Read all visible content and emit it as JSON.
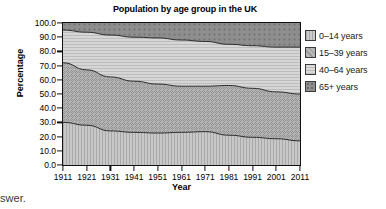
{
  "chart_data": {
    "type": "area",
    "title": "Population by age group in the UK",
    "xlabel": "Year",
    "ylabel": "Percentage",
    "stacked": true,
    "grid": true,
    "legend_position": "right",
    "xlim": [
      1911,
      2011
    ],
    "ylim": [
      0,
      100
    ],
    "categories": [
      1911,
      1921,
      1931,
      1941,
      1951,
      1961,
      1971,
      1981,
      1991,
      2001,
      2011
    ],
    "x_tick_labels": [
      "1911",
      "1921",
      "1931",
      "1941",
      "1951",
      "1961",
      "1971",
      "1981",
      "1991",
      "2001",
      "2011"
    ],
    "y_tick_labels": [
      "0.0",
      "10.0",
      "20.0",
      "30.0",
      "40.0",
      "50.0",
      "60.0",
      "70.0",
      "80.0",
      "90.0",
      "100.0"
    ],
    "y_ticks": [
      0,
      10,
      20,
      30,
      40,
      50,
      60,
      70,
      80,
      90,
      100
    ],
    "series": [
      {
        "name": "0–14 years",
        "pattern": "vertical-lines",
        "color": "#c6c6c6",
        "values": [
          30.0,
          28.0,
          24.0,
          23.0,
          22.5,
          23.0,
          23.5,
          21.0,
          19.5,
          18.5,
          17.0
        ]
      },
      {
        "name": "15–39 years",
        "pattern": "diagonal-hatch",
        "color": "#b0b0b0",
        "values": [
          42.0,
          39.0,
          38.0,
          36.0,
          34.5,
          32.5,
          32.0,
          35.0,
          34.5,
          33.0,
          33.0
        ]
      },
      {
        "name": "40–64 years",
        "pattern": "horizontal-lines",
        "color": "#d4d4d4",
        "values": [
          23.0,
          26.5,
          29.5,
          31.0,
          32.5,
          32.5,
          31.5,
          29.0,
          30.0,
          31.5,
          33.0
        ]
      },
      {
        "name": "65+ years",
        "pattern": "dotted",
        "color": "#8f8f8f",
        "values": [
          5.0,
          6.5,
          8.5,
          10.0,
          10.5,
          12.0,
          13.0,
          15.0,
          16.0,
          17.0,
          17.0
        ]
      }
    ],
    "cumulative_boundaries": {
      "top_of_0_14": [
        30.0,
        28.0,
        24.0,
        23.0,
        22.5,
        23.0,
        23.5,
        21.0,
        19.5,
        18.5,
        17.0
      ],
      "top_of_15_39": [
        72.0,
        67.0,
        62.0,
        59.0,
        57.0,
        55.5,
        55.5,
        56.0,
        54.0,
        51.5,
        50.0
      ],
      "top_of_40_64": [
        95.0,
        93.5,
        91.5,
        90.0,
        89.5,
        88.0,
        87.0,
        85.0,
        84.0,
        83.0,
        83.0
      ],
      "top_of_65_plus": [
        100,
        100,
        100,
        100,
        100,
        100,
        100,
        100,
        100,
        100,
        100
      ]
    }
  },
  "legend": {
    "items": [
      {
        "label": "0–14 years",
        "swatch": "swatch-vertical-lines"
      },
      {
        "label": "15–39 years",
        "swatch": "swatch-diagonal-hatch"
      },
      {
        "label": "40–64 years",
        "swatch": "swatch-horizontal-lines"
      },
      {
        "label": "65+ years",
        "swatch": "swatch-dotted"
      }
    ]
  },
  "page": {
    "note": "nswer."
  }
}
